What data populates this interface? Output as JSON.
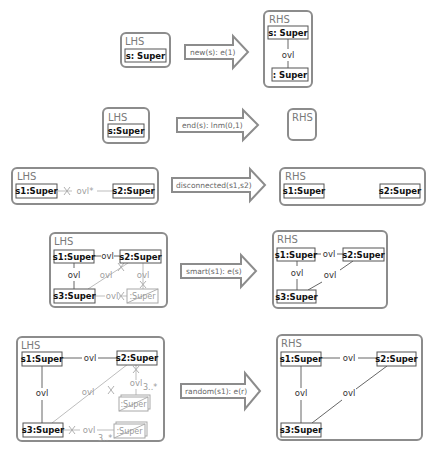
{
  "rules": [
    {
      "name": "new",
      "lhs": {
        "label": "LHS",
        "nodes": [
          "s: Super"
        ]
      },
      "operator": "new(s): e(1)",
      "rhs": {
        "label": "RHS",
        "nodes": [
          "s: Super",
          ": Super"
        ],
        "edges": [
          {
            "from": "s: Super",
            "to": ": Super",
            "label": "ovl"
          }
        ]
      }
    },
    {
      "name": "end",
      "lhs": {
        "label": "LHS",
        "nodes": [
          "s:Super"
        ]
      },
      "operator": "end(s): lnm(0,1)",
      "rhs": {
        "label": "RHS",
        "nodes": []
      }
    },
    {
      "name": "disconnected",
      "lhs": {
        "label": "LHS",
        "nodes": [
          "s1:Super",
          "s2:Super"
        ],
        "negative_edges": [
          {
            "from": "s1:Super",
            "to": "s2:Super",
            "label": "ovl*"
          }
        ]
      },
      "operator": "disconnected(s1,s2)",
      "rhs": {
        "label": "RHS",
        "nodes": [
          "s1:Super",
          "s2:Super"
        ]
      }
    },
    {
      "name": "smart",
      "lhs": {
        "label": "LHS",
        "nodes": [
          "s1:Super",
          "s2:Super",
          "s3:Super"
        ],
        "negative_nodes": [
          ":Super"
        ],
        "edges": [
          {
            "from": "s1:Super",
            "to": "s2:Super",
            "label": "ovl"
          },
          {
            "from": "s1:Super",
            "to": "s3:Super",
            "label": "ovl"
          }
        ],
        "negative_edges": [
          {
            "from": "s2:Super",
            "to": "s3:Super",
            "label": "ovl"
          },
          {
            "from": "s2:Super",
            "to": ":Super",
            "label": "ovl"
          },
          {
            "from": "s3:Super",
            "to": ":Super",
            "label": "ovl"
          }
        ]
      },
      "operator": "smart(s1): e(s)",
      "rhs": {
        "label": "RHS",
        "nodes": [
          "s1:Super",
          "s2:Super",
          "s3:Super"
        ],
        "edges": [
          {
            "from": "s1:Super",
            "to": "s2:Super",
            "label": "ovl"
          },
          {
            "from": "s1:Super",
            "to": "s3:Super",
            "label": "ovl"
          },
          {
            "from": "s2:Super",
            "to": "s3:Super",
            "label": "ovl"
          }
        ]
      }
    },
    {
      "name": "random",
      "lhs": {
        "label": "LHS",
        "nodes": [
          "s1:Super",
          "s2:Super",
          "s3:Super"
        ],
        "negative_nodes": [
          ":Super",
          ":Super"
        ],
        "edges": [
          {
            "from": "s1:Super",
            "to": "s2:Super",
            "label": "ovl"
          },
          {
            "from": "s1:Super",
            "to": "s3:Super",
            "label": "ovl"
          }
        ],
        "negative_edges": [
          {
            "from": "s2:Super",
            "to": "s3:Super",
            "label": "ovl"
          },
          {
            "from": "s2:Super",
            "to": ":Super",
            "label": "ovl",
            "multiplicity": "3..*"
          },
          {
            "from": "s3:Super",
            "to": ":Super",
            "label": "ovl",
            "multiplicity": "3..*"
          }
        ]
      },
      "operator": "random(s1): e(r)",
      "rhs": {
        "label": "RHS",
        "nodes": [
          "s1:Super",
          "s2:Super",
          "s3:Super"
        ],
        "edges": [
          {
            "from": "s1:Super",
            "to": "s2:Super",
            "label": "ovl"
          },
          {
            "from": "s1:Super",
            "to": "s3:Super",
            "label": "ovl"
          },
          {
            "from": "s2:Super",
            "to": "s3:Super",
            "label": "ovl"
          }
        ]
      }
    }
  ]
}
